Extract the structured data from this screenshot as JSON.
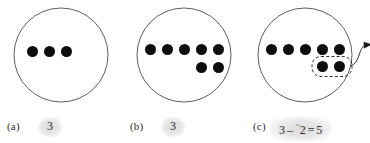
{
  "figure": {
    "stroke_color": "#4d4d4d",
    "dot_color": "#0d0d0d",
    "highlight_color": "#bfbfbf"
  },
  "panels": [
    {
      "id": "a",
      "label": "(a)",
      "answer": "3",
      "top_row_dots": 3,
      "bottom_row_dots": 0,
      "has_dashed_group": false,
      "has_arrow": false
    },
    {
      "id": "b",
      "label": "(b)",
      "answer": "3",
      "top_row_dots": 5,
      "bottom_row_dots": 2,
      "has_dashed_group": false,
      "has_arrow": false
    },
    {
      "id": "c",
      "label": "(c)",
      "answer_parts": {
        "minuend": "3",
        "operator": "–",
        "negative_sign": "⁻",
        "subtrahend": "2",
        "equals": "=",
        "result": "5"
      },
      "answer": "3 – ⁻2 = 5",
      "top_row_dots": 5,
      "bottom_row_dots": 2,
      "has_dashed_group": true,
      "has_arrow": true,
      "grouped_dots": 2
    }
  ]
}
